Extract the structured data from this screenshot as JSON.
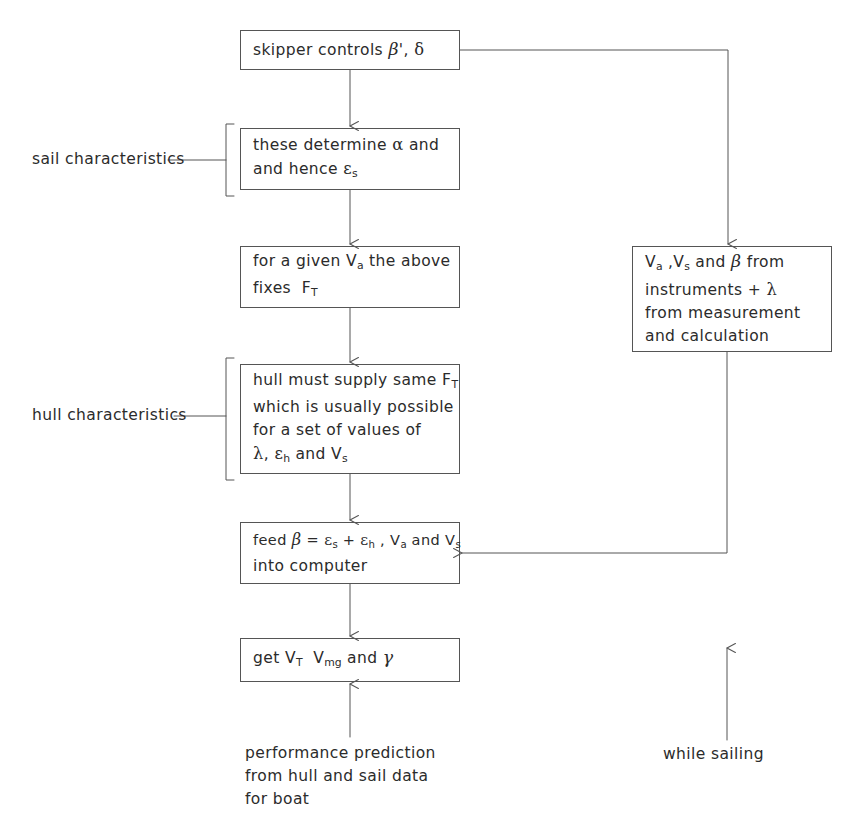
{
  "diagram": {
    "ink_color": "#2b2b2b",
    "line_color": "#555555",
    "background": "#ffffff"
  },
  "nodes": {
    "skipper": {
      "id": "skipper-controls",
      "lines": [
        "skipper controls β', δ"
      ],
      "x": 240,
      "y": 30,
      "w": 220,
      "h": 40
    },
    "sail_determine": {
      "id": "these-determine-alpha",
      "lines": [
        "these determine α and",
        "and hence εs"
      ],
      "x": 240,
      "y": 128,
      "w": 220,
      "h": 62
    },
    "given_va": {
      "id": "for-a-given-va",
      "lines": [
        "for a given Va the above",
        "fixes FT"
      ],
      "x": 240,
      "y": 246,
      "w": 220,
      "h": 62
    },
    "hull_supply": {
      "id": "hull-must-supply",
      "lines": [
        "hull must supply same FT",
        "which is usually possible",
        "for a set of values of",
        "λ, εh and Vs"
      ],
      "x": 240,
      "y": 364,
      "w": 220,
      "h": 110
    },
    "feed_beta": {
      "id": "feed-beta-into-computer",
      "lines": [
        "feed β = εs + εh , Va and Vs",
        "into computer"
      ],
      "x": 240,
      "y": 522,
      "w": 220,
      "h": 62
    },
    "get_vt": {
      "id": "get-vt-vmg-gamma",
      "lines": [
        "get VT  Vmg and γ"
      ],
      "x": 240,
      "y": 638,
      "w": 220,
      "h": 44
    },
    "instruments": {
      "id": "instruments-measurement",
      "lines": [
        "Va ,Vs and β from",
        "instruments + λ",
        "from measurement",
        "and calculation"
      ],
      "x": 632,
      "y": 246,
      "w": 200,
      "h": 106
    }
  },
  "labels": {
    "sail_characteristics": "sail characteristics",
    "hull_characteristics": "hull characteristics",
    "while_sailing": "while sailing"
  },
  "captions": {
    "performance_prediction": [
      "performance prediction",
      "from hull and sail data",
      "for boat"
    ]
  }
}
